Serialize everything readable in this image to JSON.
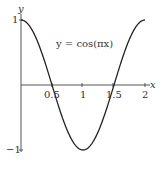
{
  "chart_data": {
    "type": "line",
    "title": "",
    "annotation": "y = cos(πx)",
    "xlabel": "x",
    "ylabel": "y",
    "xlim": [
      0,
      2
    ],
    "ylim": [
      -1,
      1
    ],
    "x_ticks": [
      "0.5",
      "1",
      "1.5",
      "2"
    ],
    "y_ticks": [
      "1",
      "−1"
    ],
    "grid": false,
    "legend": null,
    "series": [
      {
        "name": "y = cos(πx)",
        "x": [
          0,
          0.25,
          0.5,
          0.75,
          1,
          1.25,
          1.5,
          1.75,
          2
        ],
        "y": [
          1,
          0.707,
          0,
          -0.707,
          -1,
          -0.707,
          0,
          0.707,
          1
        ]
      }
    ]
  },
  "labels": {
    "equation": "y = cos(πx)",
    "x_axis": "x",
    "y_axis": "y",
    "y_tick_top": "1",
    "y_tick_bottom": "−1",
    "x_tick_0": "0.5",
    "x_tick_1": "1",
    "x_tick_2": "1.5",
    "x_tick_3": "2"
  },
  "colors": {
    "curve": "#222222",
    "axis": "#555555",
    "text": "#333333"
  }
}
